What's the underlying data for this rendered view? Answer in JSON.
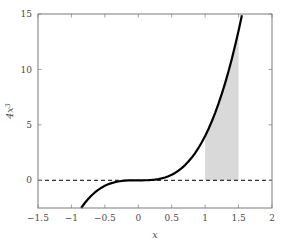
{
  "chart_data": {
    "type": "line",
    "title": "",
    "xlabel": "x",
    "ylabel": "4x^3",
    "ylabel_display": "4x",
    "ylabel_exponent": "3",
    "xlim": [
      -1.5,
      2
    ],
    "ylim": [
      -2.5,
      15
    ],
    "xticks": [
      -1.5,
      -1,
      -0.5,
      0,
      0.5,
      1,
      1.5,
      2
    ],
    "xticklabels": [
      "−1.5",
      "−1",
      "−0.5",
      "0",
      "0.5",
      "1",
      "1.5",
      "2"
    ],
    "yticks": [
      0,
      5,
      10,
      15
    ],
    "yticklabels": [
      "0",
      "5",
      "10",
      "15"
    ],
    "grid": false,
    "legend": "none",
    "series": [
      {
        "name": "4x^3",
        "type": "line",
        "color": "#000000",
        "linewidth": 2.2,
        "x": [
          -0.855,
          -0.8,
          -0.75,
          -0.7,
          -0.65,
          -0.6,
          -0.55,
          -0.5,
          -0.45,
          -0.4,
          -0.35,
          -0.3,
          -0.25,
          -0.2,
          -0.15,
          -0.1,
          -0.05,
          0,
          0.05,
          0.1,
          0.15,
          0.2,
          0.25,
          0.3,
          0.35,
          0.4,
          0.45,
          0.5,
          0.55,
          0.6,
          0.65,
          0.7,
          0.75,
          0.8,
          0.85,
          0.9,
          0.95,
          1,
          1.05,
          1.1,
          1.15,
          1.2,
          1.25,
          1.3,
          1.35,
          1.4,
          1.45,
          1.5,
          1.55
        ],
        "values": [
          -2.5,
          -2.048,
          -1.6875,
          -1.372,
          -1.0985,
          -0.864,
          -0.6655,
          -0.5,
          -0.3645,
          -0.256,
          -0.1715,
          -0.108,
          -0.0625,
          -0.032,
          -0.0135,
          -0.004,
          -0.0005,
          0,
          0.0005,
          0.004,
          0.0135,
          0.032,
          0.0625,
          0.108,
          0.1715,
          0.256,
          0.3645,
          0.5,
          0.6655,
          0.864,
          1.0985,
          1.372,
          1.6875,
          2.048,
          2.4565,
          2.916,
          3.4295,
          4,
          4.6305,
          5.324,
          6.0835,
          6.912,
          7.8125,
          8.788,
          9.8415,
          10.976,
          12.1945,
          13.5,
          14.8955
        ]
      }
    ],
    "annotations": [
      {
        "kind": "zero-line",
        "style": "dashed",
        "color": "#000000",
        "y": 0,
        "label": ""
      },
      {
        "kind": "shaded-region",
        "label": "area under curve from x=1 to x=1.5",
        "color": "#d9d9d9",
        "x_from": 1,
        "x_to": 1.5,
        "y_from": 0,
        "y_to_curve": true,
        "area_value": 3.9
      }
    ]
  },
  "axes": {
    "frame_color": "#7a7a7a",
    "tick_color": "#9a9a9a",
    "background": "#ffffff"
  }
}
